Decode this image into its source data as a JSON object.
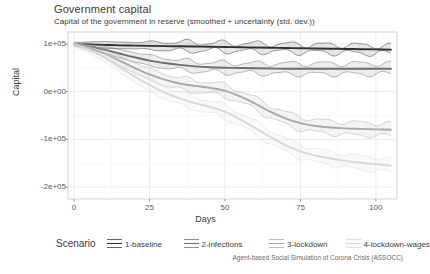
{
  "header": {
    "title": "Government capital",
    "subtitle": "Capital of the government in reserve (smoothed + uncertainty (std. dev.))"
  },
  "caption": "Agent-based Social Simulation of Corona Crisis (ASSOCC)",
  "legend": {
    "title": "Scenario",
    "items": [
      {
        "label": "1-baseline",
        "color": "#303030"
      },
      {
        "label": "2-infections",
        "color": "#6e6e6e"
      },
      {
        "label": "3-lockdown",
        "color": "#a8a8a8"
      },
      {
        "label": "4-lockdown-wages",
        "color": "#d8d8d8"
      }
    ]
  },
  "chart_data": {
    "type": "line",
    "title": "Government capital",
    "subtitle": "Capital of the government in reserve (smoothed + uncertainty (std. dev.))",
    "xlabel": "Days",
    "ylabel": "Capital",
    "xlim": [
      -2,
      107
    ],
    "ylim": [
      -225000,
      125000
    ],
    "xticks": [
      0,
      25,
      50,
      75,
      100
    ],
    "xtick_labels": [
      "0",
      "25",
      "50",
      "75",
      "100"
    ],
    "yticks": [
      100000,
      0,
      -100000,
      -200000
    ],
    "ytick_labels": [
      "1e+05",
      "0e+00",
      "-1e+05",
      "-2e+05"
    ],
    "grid": true,
    "legend_position": "bottom",
    "uncertainty": "std. dev. ribbon (oscillating envelope) around smoothed mean",
    "x": [
      0,
      5,
      10,
      15,
      20,
      25,
      30,
      35,
      40,
      45,
      50,
      55,
      60,
      65,
      70,
      75,
      80,
      85,
      90,
      95,
      100,
      105
    ],
    "series": [
      {
        "name": "1-baseline",
        "color": "#303030",
        "values": [
          100000,
          99000,
          98000,
          97000,
          96500,
          96000,
          95500,
          95000,
          94500,
          94000,
          93500,
          93000,
          92500,
          92000,
          91500,
          91000,
          90500,
          90000,
          89500,
          89000,
          88500,
          88000
        ],
        "upper": [
          103000,
          104000,
          105000,
          104000,
          103000,
          104000,
          103500,
          104000,
          103000,
          102000,
          101500,
          101000,
          100500,
          100000,
          99500,
          99000,
          98500,
          98000,
          97500,
          97000,
          96500,
          96000
        ],
        "lower": [
          97000,
          94000,
          91000,
          90000,
          90000,
          88000,
          87500,
          86000,
          86000,
          86000,
          85500,
          85000,
          84500,
          84000,
          83500,
          83000,
          82500,
          82000,
          81500,
          81000,
          80500,
          80000
        ]
      },
      {
        "name": "2-infections",
        "color": "#6e6e6e",
        "values": [
          100000,
          95000,
          88000,
          80000,
          72000,
          65000,
          60000,
          56000,
          53000,
          51000,
          50000,
          49500,
          49000,
          48500,
          48000,
          48000,
          48000,
          48000,
          48000,
          48000,
          48000,
          48000
        ],
        "upper": [
          103000,
          100000,
          95000,
          89000,
          82000,
          76000,
          70000,
          66000,
          63000,
          61000,
          60000,
          59500,
          59000,
          59000,
          59000,
          59000,
          59000,
          59000,
          59000,
          59000,
          59000,
          59000
        ],
        "lower": [
          97000,
          90000,
          81000,
          71000,
          62000,
          54000,
          50000,
          46000,
          43000,
          41000,
          40000,
          39500,
          39000,
          38000,
          37000,
          37000,
          37000,
          37000,
          37000,
          37000,
          37000,
          37000
        ]
      },
      {
        "name": "3-lockdown",
        "color": "#a8a8a8",
        "values": [
          100000,
          92000,
          80000,
          65000,
          50000,
          36000,
          25000,
          17000,
          12000,
          8000,
          2000,
          -10000,
          -25000,
          -42000,
          -56000,
          -66000,
          -72000,
          -75000,
          -77000,
          -78000,
          -79000,
          -80000
        ],
        "upper": [
          104000,
          98000,
          88000,
          75000,
          61000,
          48000,
          37000,
          29000,
          24000,
          20000,
          14000,
          2000,
          -13000,
          -29000,
          -43000,
          -53000,
          -59000,
          -62000,
          -64000,
          -65000,
          -66000,
          -67000
        ],
        "lower": [
          96000,
          86000,
          72000,
          55000,
          39000,
          24000,
          13000,
          5000,
          0,
          -4000,
          -10000,
          -22000,
          -37000,
          -55000,
          -69000,
          -79000,
          -85000,
          -88000,
          -90000,
          -91000,
          -92000,
          -93000
        ]
      },
      {
        "name": "4-lockdown-wages",
        "color": "#d8d8d8",
        "values": [
          100000,
          88000,
          72000,
          52000,
          32000,
          14000,
          -2000,
          -14000,
          -24000,
          -32000,
          -42000,
          -58000,
          -76000,
          -95000,
          -112000,
          -125000,
          -134000,
          -140000,
          -145000,
          -149000,
          -152000,
          -155000
        ],
        "upper": [
          105000,
          95000,
          81000,
          63000,
          44000,
          27000,
          11000,
          -1000,
          -11000,
          -19000,
          -29000,
          -45000,
          -62000,
          -81000,
          -98000,
          -111000,
          -120000,
          -126000,
          -131000,
          -135000,
          -138000,
          -141000
        ],
        "lower": [
          95000,
          81000,
          63000,
          41000,
          20000,
          1000,
          -15000,
          -27000,
          -37000,
          -45000,
          -55000,
          -71000,
          -90000,
          -109000,
          -126000,
          -139000,
          -148000,
          -154000,
          -159000,
          -163000,
          -166000,
          -169000
        ]
      }
    ]
  }
}
